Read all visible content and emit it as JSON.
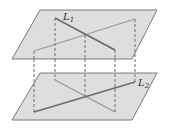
{
  "figure": {
    "colors": {
      "background": "#ffffff",
      "plane_fill": "#dedede",
      "plane_edge": "#7a7a7a",
      "line_l1": "#6b6b6b",
      "line_other": "#9a9a9a",
      "dashed": "#6f6f6f",
      "label": "#333333"
    },
    "upper_plane": {
      "points": "40,10 157,10 132,59 12,59",
      "line_L1": {
        "x1": 55,
        "y1": 18,
        "x2": 115,
        "y2": 50
      },
      "line_projection_of_L2": {
        "x1": 34,
        "y1": 51,
        "x2": 135,
        "y2": 19
      },
      "label": {
        "text": "L",
        "sub": "1",
        "x": 63,
        "y": 20
      }
    },
    "lower_plane": {
      "points": "40,73 157,73 132,120 12,120",
      "line_L2": {
        "x1": 34,
        "y1": 112,
        "x2": 135,
        "y2": 82
      },
      "line_projection_of_L1": {
        "x1": 55,
        "y1": 80,
        "x2": 115,
        "y2": 112
      },
      "label": {
        "text": "L",
        "sub": "2",
        "x": 138,
        "y": 86
      }
    },
    "dashed_verticals": [
      {
        "x": 34,
        "y1": 51,
        "y2": 112
      },
      {
        "x": 55,
        "y1": 18,
        "y2": 80
      },
      {
        "x": 85,
        "y1": 35,
        "y2": 96
      },
      {
        "x": 115,
        "y1": 50,
        "y2": 112
      },
      {
        "x": 135,
        "y1": 19,
        "y2": 82
      }
    ]
  }
}
